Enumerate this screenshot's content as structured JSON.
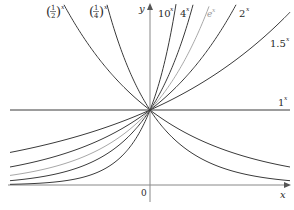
{
  "chart_data": {
    "type": "line",
    "title": "",
    "xlabel": "x",
    "ylabel": "y",
    "origin_label": "0",
    "grid": false,
    "legend_position": "inline labels",
    "series": [
      {
        "name": "(1/2)^x",
        "base": 0.5,
        "color": "#3a3a3a",
        "label_parts": [
          "1",
          "2"
        ]
      },
      {
        "name": "(1/4)^x",
        "base": 0.25,
        "color": "#3a3a3a",
        "label_parts": [
          "1",
          "4"
        ]
      },
      {
        "name": "10^x",
        "base": 10,
        "color": "#3a3a3a",
        "label": "10"
      },
      {
        "name": "4^x",
        "base": 4,
        "color": "#3a3a3a",
        "label": "4"
      },
      {
        "name": "e^x",
        "base": 2.71828,
        "color": "#a8a8a8",
        "label": "e"
      },
      {
        "name": "2^x",
        "base": 2,
        "color": "#3a3a3a",
        "label": "2"
      },
      {
        "name": "1.5^x",
        "base": 1.5,
        "color": "#3a3a3a",
        "label": "1.5"
      },
      {
        "name": "1^x",
        "base": 1,
        "color": "#3a3a3a",
        "label": "1"
      }
    ],
    "exponent": "x",
    "xlim": [
      -2.05,
      2.1
    ],
    "ylim": [
      -0.35,
      2.45
    ],
    "common_point": [
      0,
      1
    ]
  }
}
